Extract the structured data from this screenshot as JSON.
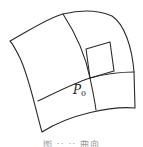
{
  "figure": {
    "type": "surface-patch-diagram",
    "point_label": {
      "base": "P",
      "subscript": "0"
    },
    "caption": "图 ·· ·· 曲面",
    "colors": {
      "line": "#2a2a2a",
      "background": "#ffffff",
      "caption": "#9a9a9a"
    },
    "geometry": {
      "outer_boundary": "M10,41 C30,30 48,18 63,14 C80,10 98,10 112,16 C124,24 132,46 134,72 L135,108 C112,106 70,114 42,132 C35,108 30,80 20,58 C16,50 13,44 10,41 Z",
      "u_curve": "M63,14 C76,34 86,58 90,78 C93,92 95,102 96,110",
      "v_curve": "M38,101 C55,93 72,84 90,78 C105,74 120,72 134,72",
      "tangent_rect": "M86,49 L110,42 L114,71 L90,78 Z"
    }
  }
}
